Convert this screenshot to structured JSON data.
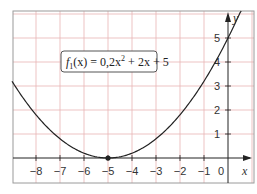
{
  "chart_data": {
    "type": "line",
    "title": "",
    "xlabel": "x",
    "ylabel": "y",
    "xlim": [
      -9,
      1.08
    ],
    "ylim": [
      -1.05,
      6.1
    ],
    "grid": true,
    "x_ticks": [
      -8,
      -7,
      -6,
      -5,
      -4,
      -3,
      -2,
      -1,
      0
    ],
    "x_tick_labels": [
      "−8",
      "−7",
      "−6",
      "−5",
      "−4",
      "−3",
      "−2",
      "−1",
      "0"
    ],
    "y_ticks": [
      1,
      2,
      3,
      4,
      5
    ],
    "y_tick_labels": [
      "1",
      "2",
      "3",
      "4",
      "5"
    ],
    "series": [
      {
        "name": "f1(x) = 0,2x² + 2x + 5",
        "function": "0.2*x^2 + 2*x + 5",
        "x": [
          -9,
          -8,
          -7,
          -6,
          -5,
          -4,
          -3,
          -2,
          -1,
          0,
          0.5
        ],
        "values": [
          3.2,
          1.8,
          0.8,
          0.2,
          0,
          0.2,
          0.8,
          1.8,
          3.2,
          5,
          6.05
        ]
      }
    ],
    "annotations": [
      {
        "type": "point",
        "x": -5,
        "y": 0,
        "label": "vertex"
      },
      {
        "type": "label_box",
        "text_parts": {
          "f": "f",
          "sub": "1",
          "rest": "(x) = 0,2x",
          "sup": "2",
          "tail": " + 2x + 5"
        }
      }
    ]
  },
  "colors": {
    "grid": "#e8b4b4",
    "axis": "#222222",
    "curve": "#222222",
    "frame": "#9a9a9a",
    "label_box_border": "#555555"
  },
  "labels": {
    "x_axis": "x",
    "y_axis": "y",
    "func_f": "f",
    "func_sub": "1",
    "func_rest": "(x) = 0,2x",
    "func_sup": "2",
    "func_tail": " + 2x + 5"
  }
}
